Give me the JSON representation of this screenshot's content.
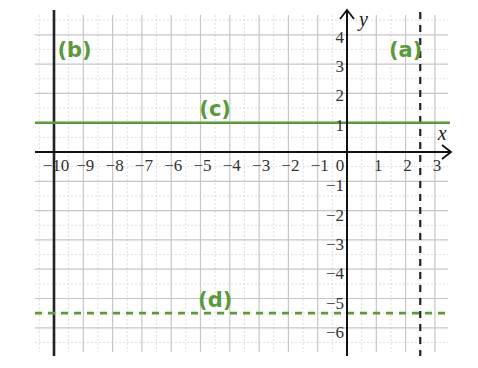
{
  "chart_data": {
    "type": "line",
    "title": "",
    "xlabel": "x",
    "ylabel": "y",
    "xlim": [
      -10.65,
      3.45
    ],
    "ylim": [
      -6.8,
      4.65
    ],
    "grid": true,
    "minor_grid": true,
    "x_ticks": [
      -10,
      -9,
      -8,
      -7,
      -6,
      -5,
      -4,
      -3,
      -2,
      -1,
      0,
      1,
      2,
      3
    ],
    "x_tick_labels": [
      "−10",
      "−9",
      "−8",
      "−7",
      "−6",
      "−5",
      "−4",
      "−3",
      "−2",
      "−1",
      "0",
      "1",
      "2",
      "3"
    ],
    "y_ticks": [
      4,
      3,
      2,
      1,
      -1,
      -2,
      -3,
      -4,
      -5,
      -6
    ],
    "y_tick_labels": [
      "4",
      "3",
      "2",
      "1",
      "−1",
      "−2",
      "−3",
      "−4",
      "−5",
      "−6"
    ],
    "series": [
      {
        "name": "(a)",
        "kind": "vertical",
        "x": 2.5,
        "style": "dashed",
        "color": "#222222",
        "label_pos": [
          2.0,
          3.5
        ]
      },
      {
        "name": "(b)",
        "kind": "vertical",
        "x": -10,
        "style": "solid",
        "color": "#222222",
        "label_pos": [
          -9.3,
          3.5
        ]
      },
      {
        "name": "(c)",
        "kind": "horizontal",
        "y": 1,
        "style": "solid",
        "color": "#5a9a3c",
        "label_pos": [
          -4.5,
          1.5
        ]
      },
      {
        "name": "(d)",
        "kind": "horizontal",
        "y": -5.5,
        "style": "dashed",
        "color": "#5a9a3c",
        "label_pos": [
          -4.5,
          -5.0
        ]
      }
    ]
  },
  "colors": {
    "green": "#5a9a3c",
    "axis": "#111111",
    "grid": "#c6c6c6",
    "minor_grid": "#dedede"
  }
}
